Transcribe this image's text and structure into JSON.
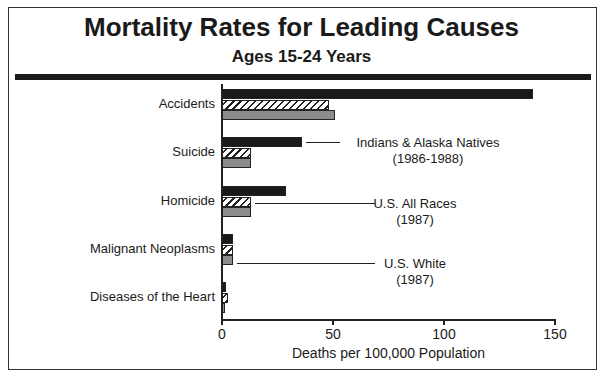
{
  "chart_data": {
    "type": "bar",
    "orientation": "horizontal",
    "title": "Mortality Rates for Leading Causes",
    "subtitle": "Ages 15-24 Years",
    "xlabel": "Deaths per 100,000 Population",
    "ylabel": "",
    "xlim": [
      0,
      150
    ],
    "xticks": [
      "0",
      "50",
      "100",
      "150"
    ],
    "grid": false,
    "legend_position": "inline-right",
    "categories": [
      "Accidents",
      "Suicide",
      "Homicide",
      "Malignant Neoplasms",
      "Diseases of the Heart"
    ],
    "series": [
      {
        "name": "Indians & Alaska Natives (1986-1988)",
        "label_line1": "Indians & Alaska Natives",
        "label_line2": "(1986-1988)",
        "fill": "solid-black",
        "values": [
          140,
          36,
          29,
          5,
          2
        ]
      },
      {
        "name": "U.S. All Races (1987)",
        "label_line1": "U.S. All Races",
        "label_line2": "(1987)",
        "fill": "hatched",
        "values": [
          48,
          13,
          13,
          5,
          2.5
        ]
      },
      {
        "name": "U.S. White (1987)",
        "label_line1": "U.S. White",
        "label_line2": "(1987)",
        "fill": "gray",
        "values": [
          51,
          13,
          13,
          5,
          1.5
        ]
      }
    ]
  }
}
